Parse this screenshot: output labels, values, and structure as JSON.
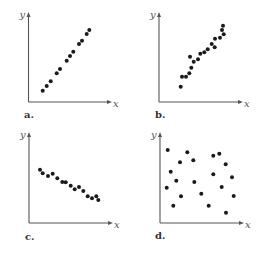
{
  "chart_data": [
    {
      "type": "scatter",
      "panel_label": "a.",
      "xlabel": "x",
      "ylabel": "y",
      "description": "strong positive linear correlation",
      "origin": [
        28.5,
        102
      ],
      "points": [
        [
          42.7,
          90.7
        ],
        [
          46.7,
          86
        ],
        [
          50.7,
          81.3
        ],
        [
          56.7,
          73.3
        ],
        [
          60,
          69
        ],
        [
          66.7,
          60.7
        ],
        [
          70,
          56
        ],
        [
          73.3,
          51.7
        ],
        [
          79,
          44
        ],
        [
          82,
          40.7
        ],
        [
          86.7,
          34
        ],
        [
          89.3,
          30
        ]
      ],
      "axis_end": {
        "x_right": 112,
        "y_top": 12
      },
      "label_pos": {
        "x": [
          114,
          108
        ],
        "y": [
          19,
          18
        ],
        "panel": [
          24,
          118
        ]
      }
    },
    {
      "type": "scatter",
      "panel_label": "b.",
      "xlabel": "x",
      "ylabel": "y",
      "description": "positive correlation with some scatter",
      "origin": [
        159,
        102
      ],
      "points": [
        [
          180.7,
          86.7
        ],
        [
          182,
          76.7
        ],
        [
          186,
          76.7
        ],
        [
          189.3,
          73.3
        ],
        [
          191.3,
          67.7
        ],
        [
          190,
          56.7
        ],
        [
          193.7,
          61.7
        ],
        [
          198,
          59.3
        ],
        [
          200.3,
          53.7
        ],
        [
          204.3,
          52.3
        ],
        [
          207.7,
          49.3
        ],
        [
          211.7,
          44
        ],
        [
          214.7,
          47.3
        ],
        [
          215,
          38.7
        ],
        [
          220,
          37.7
        ],
        [
          223.7,
          34.3
        ],
        [
          222,
          30
        ],
        [
          223,
          25.7
        ]
      ],
      "axis_end": {
        "x_right": 243,
        "y_top": 12
      },
      "label_pos": {
        "x": [
          245,
          108
        ],
        "y": [
          149,
          18
        ],
        "panel": [
          155,
          118
        ]
      }
    },
    {
      "type": "scatter",
      "panel_label": "c.",
      "xlabel": "x",
      "ylabel": "y",
      "description": "negative linear correlation",
      "origin": [
        29,
        223
      ],
      "points": [
        [
          40,
          169.7
        ],
        [
          42.7,
          173.3
        ],
        [
          48,
          176
        ],
        [
          52.7,
          173.7
        ],
        [
          57.3,
          178.3
        ],
        [
          62.3,
          182
        ],
        [
          65.7,
          182.3
        ],
        [
          70.7,
          185.7
        ],
        [
          74.7,
          189.3
        ],
        [
          79,
          187
        ],
        [
          83.3,
          191
        ],
        [
          87.7,
          196.3
        ],
        [
          92,
          198.3
        ],
        [
          96.3,
          196.3
        ],
        [
          98.3,
          200
        ]
      ],
      "axis_end": {
        "x_right": 113,
        "y_top": 132
      },
      "label_pos": {
        "x": [
          115,
          230
        ],
        "y": [
          19,
          139
        ],
        "panel": [
          25,
          240
        ]
      }
    },
    {
      "type": "scatter",
      "panel_label": "d.",
      "xlabel": "x",
      "ylabel": "y",
      "description": "no correlation",
      "origin": [
        160,
        223
      ],
      "points": [
        [
          167.7,
          150
        ],
        [
          187.3,
          152.3
        ],
        [
          213.3,
          155.7
        ],
        [
          219.3,
          153.7
        ],
        [
          180,
          162.3
        ],
        [
          193.3,
          160.3
        ],
        [
          225.7,
          164.3
        ],
        [
          170.7,
          171.7
        ],
        [
          213.3,
          174.3
        ],
        [
          232,
          177.3
        ],
        [
          176.3,
          180.7
        ],
        [
          194.3,
          182
        ],
        [
          221.7,
          187
        ],
        [
          166.7,
          187.7
        ],
        [
          201.3,
          193.7
        ],
        [
          181,
          196.3
        ],
        [
          233.7,
          196
        ],
        [
          173.3,
          205.7
        ],
        [
          208.7,
          205.7
        ],
        [
          226,
          212.7
        ]
      ],
      "axis_end": {
        "x_right": 244,
        "y_top": 132
      },
      "label_pos": {
        "x": [
          246,
          230
        ],
        "y": [
          150,
          139
        ],
        "panel": [
          155,
          239
        ]
      }
    }
  ]
}
